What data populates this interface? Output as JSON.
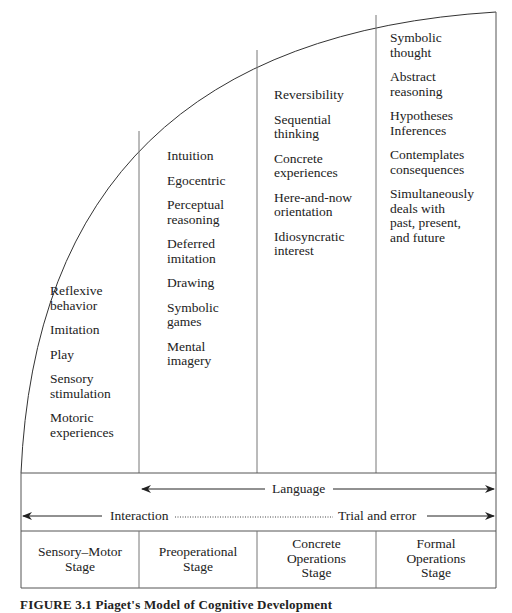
{
  "diagram": {
    "title": "Piaget's Model of Cognitive Development",
    "caption": "FIGURE 3.1   Piaget's Model of Cognitive Development",
    "columns": [
      {
        "stage": "Sensory–Motor\nStage",
        "items": [
          "Reflexive\nbehavior",
          "Imitation",
          "Play",
          "Sensory\nstimulation",
          "Motoric\nexperiences"
        ]
      },
      {
        "stage": "Preoperational\nStage",
        "items": [
          "Intuition",
          "Egocentric",
          "Perceptual\nreasoning",
          "Deferred\nimitation",
          "Drawing",
          "Symbolic\ngames",
          "Mental\nimagery"
        ]
      },
      {
        "stage": "Concrete\nOperations\nStage",
        "items": [
          "Reversibility",
          "Sequential\nthinking",
          "Concrete\nexperiences",
          "Here-and-now\norientation",
          "Idiosyncratic\ninterest"
        ]
      },
      {
        "stage": "Formal\nOperations\nStage",
        "items": [
          "Symbolic\nthought",
          "Abstract\nreasoning",
          "Hypotheses\nInferences",
          "Contemplates\nconsequences",
          "Simultaneously\ndeals with\npast, present,\nand future"
        ]
      }
    ],
    "arrows": {
      "language": "Language",
      "interaction": "Interaction",
      "trial_and_error": "Trial and error"
    }
  }
}
